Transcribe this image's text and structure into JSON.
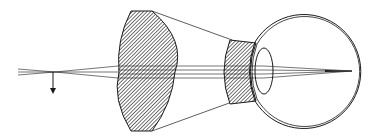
{
  "diagram": {
    "title": "Telescopic spectacle (Galilean) magnifier in front of the eye",
    "colors": {
      "stroke": "#1a1a1a",
      "hatch": "#2b2b2b",
      "background": "#ffffff"
    },
    "elements": {
      "object_arrow": "downward arrow at object plane",
      "objective_lens": "large biconvex hatched lens",
      "eyepiece_lens": "small concave hatched lens",
      "eye": "eyeball outline with cornea",
      "crystalline_lens": "lens inside eye",
      "rays": "converging light rays to retina focal point"
    }
  }
}
